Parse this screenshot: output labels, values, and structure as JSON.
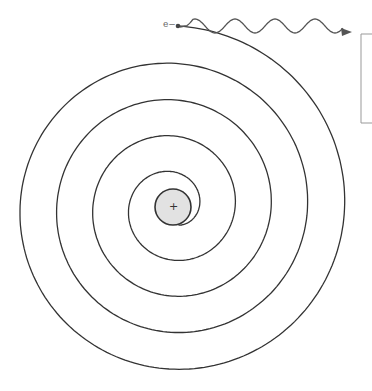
{
  "diagram": {
    "electron": {
      "label": "e−",
      "x": 178,
      "y": 26
    },
    "nucleus": {
      "label": "+",
      "cx": 173,
      "cy": 207,
      "r": 18,
      "fill": "#e2e2e2",
      "stroke": "#333333"
    },
    "spiral": {
      "stroke": "#333333",
      "turns": 4.5,
      "outer_radius": 175,
      "inner_radius": 20
    },
    "emission": {
      "type": "wavy-arrow",
      "from_x": 190,
      "to_x": 352,
      "y": 28,
      "stroke": "#555555"
    },
    "side_box": {
      "x": 361,
      "y": 34,
      "width": 14,
      "height": 89,
      "stroke": "#999999"
    }
  }
}
